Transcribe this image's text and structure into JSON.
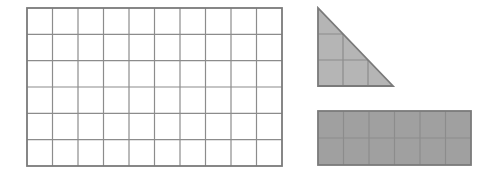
{
  "figure": {
    "colors": {
      "background": "#ffffff",
      "grid_line": "#8c8c8c",
      "outline": "#7a7a7a",
      "triangle_fill": "#b5b5b5",
      "rectangle_fill": "#a0a0a0"
    }
  },
  "shapes": {
    "large_grid": {
      "x": 27,
      "y": 8,
      "width": 255,
      "height": 158,
      "columns": 10,
      "rows": 6,
      "shaded": false
    },
    "triangle": {
      "x": 318,
      "y": 8,
      "leg_width": 75,
      "leg_height": 78,
      "grid_units": 3,
      "shaded": true
    },
    "small_rectangle": {
      "x": 318,
      "y": 111,
      "width": 153,
      "height": 54,
      "columns": 6,
      "rows": 2,
      "shaded": true
    }
  }
}
